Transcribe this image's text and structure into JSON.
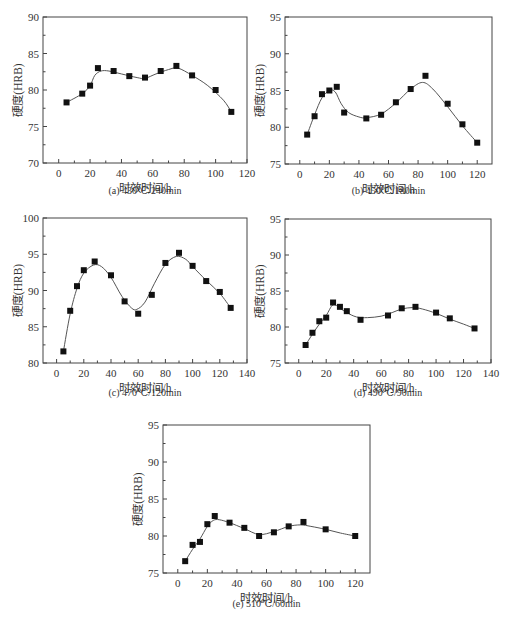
{
  "chart_data": [
    {
      "id": "a",
      "type": "line",
      "title": "(a) 430℃/240min",
      "xlabel": "时效时间/h",
      "ylabel": "硬度(HRB)",
      "xlim": [
        -10,
        120
      ],
      "ylim": [
        70,
        90
      ],
      "xticks": [
        0,
        20,
        40,
        60,
        80,
        100,
        120
      ],
      "yticks": [
        70,
        75,
        80,
        85,
        90
      ],
      "grid": false,
      "marker": "square",
      "line": "smooth-fit",
      "series": [
        {
          "name": "hardness",
          "x": [
            5,
            15,
            20,
            25,
            35,
            45,
            55,
            65,
            75,
            85,
            100,
            110
          ],
          "y": [
            78.3,
            79.5,
            80.6,
            83.0,
            82.6,
            81.9,
            81.7,
            82.6,
            83.3,
            82.0,
            80.0,
            77.0
          ]
        }
      ],
      "fit_curve": {
        "x": [
          5,
          15,
          20,
          23,
          27,
          32,
          40,
          50,
          55,
          62,
          70,
          76,
          85,
          95,
          105,
          110
        ],
        "y": [
          78.3,
          79.5,
          80.6,
          82.0,
          82.6,
          82.6,
          82.2,
          81.7,
          81.6,
          82.2,
          82.8,
          83.0,
          82.0,
          80.6,
          78.6,
          77.0
        ]
      }
    },
    {
      "id": "b",
      "type": "line",
      "title": "(b) 450℃/180min",
      "xlabel": "时效时间/h",
      "ylabel": "硬度(HRB)",
      "xlim": [
        -10,
        130
      ],
      "ylim": [
        75,
        95
      ],
      "xticks": [
        0,
        20,
        40,
        60,
        80,
        100,
        120
      ],
      "yticks": [
        75,
        80,
        85,
        90,
        95
      ],
      "grid": false,
      "marker": "square",
      "line": "smooth-fit",
      "series": [
        {
          "name": "hardness",
          "x": [
            5,
            10,
            15,
            20,
            25,
            30,
            45,
            55,
            65,
            75,
            85,
            100,
            110,
            120
          ],
          "y": [
            79.0,
            81.5,
            84.5,
            85.0,
            85.5,
            82.0,
            81.2,
            81.7,
            83.4,
            85.2,
            87.0,
            83.2,
            80.4,
            77.9
          ]
        }
      ],
      "fit_curve": {
        "x": [
          5,
          10,
          15,
          20,
          24,
          28,
          33,
          40,
          45,
          55,
          65,
          75,
          83,
          90,
          100,
          110,
          120
        ],
        "y": [
          79.0,
          81.7,
          84.0,
          85.0,
          84.8,
          83.2,
          82.0,
          81.4,
          81.3,
          81.8,
          83.3,
          85.2,
          86.1,
          85.2,
          82.8,
          80.2,
          77.9
        ]
      }
    },
    {
      "id": "c",
      "type": "line",
      "title": "(c) 470℃/120min",
      "xlabel": "时效时间/h",
      "ylabel": "硬度(HRB)",
      "xlim": [
        -10,
        140
      ],
      "ylim": [
        80,
        100
      ],
      "xticks": [
        0,
        20,
        40,
        60,
        80,
        100,
        120,
        140
      ],
      "yticks": [
        80,
        85,
        90,
        95,
        100
      ],
      "grid": false,
      "marker": "square",
      "line": "smooth-fit",
      "series": [
        {
          "name": "hardness",
          "x": [
            5,
            10,
            15,
            20,
            28,
            40,
            50,
            60,
            70,
            80,
            90,
            100,
            110,
            120,
            128
          ],
          "y": [
            81.6,
            87.2,
            90.6,
            92.8,
            94.0,
            92.1,
            88.5,
            86.8,
            89.4,
            93.8,
            95.2,
            93.4,
            91.3,
            89.8,
            87.6
          ]
        }
      ],
      "fit_curve": {
        "x": [
          5,
          10,
          15,
          20,
          27,
          33,
          40,
          48,
          55,
          59,
          65,
          72,
          80,
          88,
          95,
          100,
          110,
          120,
          128
        ],
        "y": [
          81.6,
          86.8,
          90.3,
          92.4,
          93.5,
          93.3,
          91.8,
          89.2,
          87.6,
          87.4,
          88.4,
          91.0,
          93.6,
          94.7,
          94.3,
          93.3,
          91.4,
          89.6,
          87.6
        ]
      }
    },
    {
      "id": "d",
      "type": "line",
      "title": "(d) 490℃/90min",
      "xlabel": "时效时间/h",
      "ylabel": "硬度(HRB)",
      "xlim": [
        -10,
        140
      ],
      "ylim": [
        75,
        95
      ],
      "xticks": [
        0,
        20,
        40,
        60,
        80,
        100,
        120,
        140
      ],
      "yticks": [
        75,
        80,
        85,
        90,
        95
      ],
      "grid": false,
      "marker": "square",
      "line": "smooth-fit",
      "series": [
        {
          "name": "hardness",
          "x": [
            5,
            10,
            15,
            20,
            25,
            30,
            35,
            45,
            65,
            75,
            85,
            100,
            110,
            128
          ],
          "y": [
            77.5,
            79.2,
            80.8,
            81.3,
            83.4,
            82.8,
            82.2,
            81.0,
            81.6,
            82.6,
            82.8,
            82.0,
            81.2,
            79.8
          ]
        }
      ],
      "fit_curve": {
        "x": [
          5,
          10,
          15,
          20,
          25,
          30,
          35,
          42,
          50,
          60,
          68,
          75,
          83,
          90,
          100,
          110,
          120,
          128
        ],
        "y": [
          77.5,
          79.0,
          80.4,
          81.6,
          83.1,
          82.6,
          82.0,
          81.4,
          81.3,
          81.5,
          82.0,
          82.5,
          82.7,
          82.5,
          81.9,
          81.1,
          80.4,
          79.8
        ]
      }
    },
    {
      "id": "e",
      "type": "line",
      "title": "(e) 510℃/60min",
      "xlabel": "时效时间/h",
      "ylabel": "硬度(HRB)",
      "xlim": [
        -10,
        130
      ],
      "ylim": [
        75,
        95
      ],
      "xticks": [
        0,
        20,
        40,
        60,
        80,
        100,
        120
      ],
      "yticks": [
        75,
        80,
        85,
        90,
        95
      ],
      "grid": false,
      "marker": "square",
      "line": "smooth-fit",
      "series": [
        {
          "name": "hardness",
          "x": [
            5,
            10,
            15,
            20,
            25,
            35,
            45,
            55,
            65,
            75,
            85,
            100,
            120
          ],
          "y": [
            76.6,
            78.8,
            79.2,
            81.6,
            82.7,
            81.8,
            81.1,
            80.0,
            80.5,
            81.3,
            81.9,
            80.9,
            80.0
          ]
        }
      ],
      "fit_curve": {
        "x": [
          5,
          10,
          15,
          20,
          24,
          28,
          35,
          45,
          55,
          65,
          75,
          83,
          90,
          100,
          110,
          120
        ],
        "y": [
          76.6,
          78.2,
          79.6,
          81.3,
          82.1,
          82.2,
          81.8,
          81.0,
          80.2,
          80.6,
          81.3,
          81.5,
          81.3,
          80.9,
          80.4,
          80.0
        ]
      }
    }
  ],
  "layout": {
    "panels": [
      {
        "id": "a",
        "frame": {
          "left": 43,
          "top": 17,
          "right": 247,
          "bottom": 163
        },
        "caption_y": 190
      },
      {
        "id": "b",
        "frame": {
          "left": 285,
          "top": 17,
          "right": 492,
          "bottom": 164
        },
        "caption_y": 190
      },
      {
        "id": "c",
        "frame": {
          "left": 43,
          "top": 218,
          "right": 247,
          "bottom": 363
        },
        "caption_y": 392
      },
      {
        "id": "d",
        "frame": {
          "left": 285,
          "top": 219,
          "right": 491,
          "bottom": 363
        },
        "caption_y": 392
      },
      {
        "id": "e",
        "frame": {
          "left": 163,
          "top": 425,
          "right": 370,
          "bottom": 573
        },
        "caption_y": 603
      }
    ],
    "line_color": "#555555",
    "marker_color": "#111111",
    "axis_color": "#444444"
  }
}
